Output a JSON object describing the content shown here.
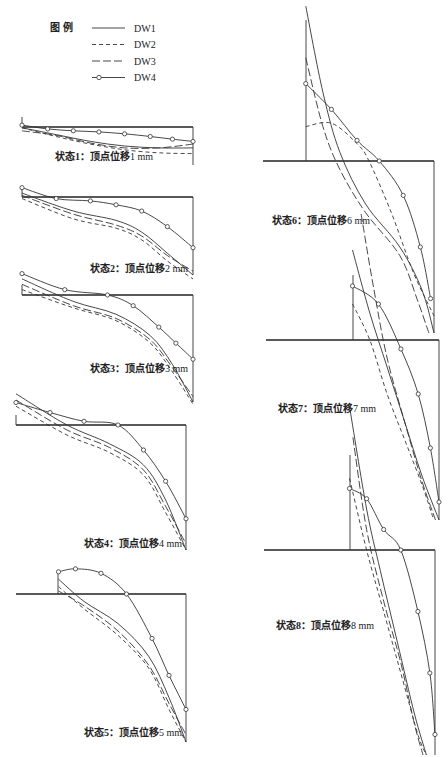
{
  "chart_data": {
    "type": "line",
    "legend": {
      "title": "图 例",
      "placement": "top-left",
      "entries": [
        {
          "name": "DW1",
          "style": "solid"
        },
        {
          "name": "DW2",
          "style": "short-dash"
        },
        {
          "name": "DW3",
          "style": "long-dash"
        },
        {
          "name": "DW4",
          "style": "solid-circle-marker"
        }
      ]
    },
    "series_names": [
      "DW1",
      "DW2",
      "DW3",
      "DW4"
    ],
    "xlabel": "",
    "ylabel": "",
    "panels": [
      {
        "id": 1,
        "caption_prefix": "状态1：顶点位移",
        "caption_value": "1 mm",
        "series": {
          "DW1": [
            [
              0,
              0.02
            ],
            [
              0.2,
              0.2
            ],
            [
              0.4,
              0.38
            ],
            [
              0.6,
              0.5
            ],
            [
              0.8,
              0.55
            ],
            [
              1,
              0.55
            ]
          ],
          "DW2": [
            [
              0,
              0.02
            ],
            [
              0.2,
              0.25
            ],
            [
              0.4,
              0.45
            ],
            [
              0.6,
              0.6
            ],
            [
              0.8,
              0.68
            ],
            [
              1,
              0.7
            ]
          ],
          "DW3": [
            [
              0,
              0.1
            ],
            [
              0.2,
              0.22
            ],
            [
              0.4,
              0.42
            ],
            [
              0.6,
              0.55
            ],
            [
              0.8,
              0.55
            ],
            [
              1,
              0.45
            ]
          ],
          "DW4": [
            [
              0,
              -0.05
            ],
            [
              0.15,
              0.05
            ],
            [
              0.3,
              0.1
            ],
            [
              0.45,
              0.13
            ],
            [
              0.6,
              0.18
            ],
            [
              0.75,
              0.25
            ],
            [
              0.88,
              0.32
            ],
            [
              1,
              0.38
            ]
          ]
        }
      },
      {
        "id": 2,
        "caption_prefix": "状态2：顶点位移",
        "caption_value": "2 mm",
        "series": {
          "DW1": [
            [
              0,
              -0.05
            ],
            [
              0.3,
              0.18
            ],
            [
              0.55,
              0.3
            ],
            [
              0.7,
              0.45
            ],
            [
              0.85,
              0.72
            ],
            [
              1,
              1.0
            ]
          ],
          "DW2": [
            [
              0,
              0.02
            ],
            [
              0.3,
              0.28
            ],
            [
              0.55,
              0.4
            ],
            [
              0.7,
              0.55
            ],
            [
              0.85,
              0.82
            ],
            [
              1,
              1.05
            ]
          ],
          "DW3": [
            [
              0,
              -0.02
            ],
            [
              0.3,
              0.22
            ],
            [
              0.55,
              0.36
            ],
            [
              0.7,
              0.5
            ],
            [
              0.85,
              0.75
            ],
            [
              1,
              0.95
            ]
          ],
          "DW4": [
            [
              0,
              -0.12
            ],
            [
              0.2,
              0.02
            ],
            [
              0.4,
              0.05
            ],
            [
              0.55,
              0.1
            ],
            [
              0.7,
              0.18
            ],
            [
              0.85,
              0.38
            ],
            [
              1,
              0.65
            ]
          ]
        }
      },
      {
        "id": 3,
        "caption_prefix": "状态3：顶点位移",
        "caption_value": "3 mm",
        "series": {
          "DW1": [
            [
              0,
              -0.15
            ],
            [
              0.3,
              0.06
            ],
            [
              0.55,
              0.18
            ],
            [
              0.75,
              0.38
            ],
            [
              0.88,
              0.65
            ],
            [
              1,
              1.0
            ]
          ],
          "DW2": [
            [
              0,
              -0.05
            ],
            [
              0.3,
              0.12
            ],
            [
              0.55,
              0.24
            ],
            [
              0.75,
              0.45
            ],
            [
              0.88,
              0.72
            ],
            [
              1,
              1.02
            ]
          ],
          "DW3": [
            [
              0,
              -0.1
            ],
            [
              0.3,
              0.1
            ],
            [
              0.55,
              0.22
            ],
            [
              0.75,
              0.42
            ],
            [
              0.88,
              0.68
            ],
            [
              1,
              0.95
            ]
          ],
          "DW4": [
            [
              0,
              -0.2
            ],
            [
              0.25,
              -0.05
            ],
            [
              0.5,
              0.0
            ],
            [
              0.65,
              0.1
            ],
            [
              0.8,
              0.3
            ],
            [
              0.9,
              0.45
            ],
            [
              1,
              0.6
            ]
          ]
        }
      },
      {
        "id": 4,
        "caption_prefix": "状态4：顶点位移",
        "caption_value": "4 mm",
        "series": {
          "DW1": [
            [
              0,
              -0.25
            ],
            [
              0.3,
              0.0
            ],
            [
              0.55,
              0.15
            ],
            [
              0.75,
              0.32
            ],
            [
              0.88,
              0.6
            ],
            [
              1,
              1.0
            ]
          ],
          "DW2": [
            [
              0,
              -0.15
            ],
            [
              0.3,
              0.08
            ],
            [
              0.55,
              0.22
            ],
            [
              0.75,
              0.4
            ],
            [
              0.88,
              0.7
            ],
            [
              1,
              1.0
            ]
          ],
          "DW3": [
            [
              0,
              -0.2
            ],
            [
              0.3,
              0.04
            ],
            [
              0.55,
              0.18
            ],
            [
              0.75,
              0.36
            ],
            [
              0.88,
              0.65
            ],
            [
              1,
              0.95
            ]
          ],
          "DW4": [
            [
              0,
              -0.18
            ],
            [
              0.2,
              -0.1
            ],
            [
              0.4,
              -0.03
            ],
            [
              0.6,
              0.0
            ],
            [
              0.75,
              0.2
            ],
            [
              0.88,
              0.45
            ],
            [
              1,
              0.75
            ]
          ]
        }
      },
      {
        "id": 5,
        "caption_prefix": "状态5：顶点位移",
        "caption_value": "5 mm",
        "series": {
          "DW1": [
            [
              0.25,
              -0.1
            ],
            [
              0.4,
              0.05
            ],
            [
              0.6,
              0.2
            ],
            [
              0.78,
              0.42
            ],
            [
              0.9,
              0.7
            ],
            [
              1,
              1.0
            ]
          ],
          "DW2": [
            [
              0.25,
              -0.05
            ],
            [
              0.4,
              0.1
            ],
            [
              0.6,
              0.28
            ],
            [
              0.78,
              0.5
            ],
            [
              0.9,
              0.78
            ],
            [
              1,
              1.0
            ]
          ],
          "DW3": [
            [
              0.25,
              -0.02
            ],
            [
              0.4,
              0.08
            ],
            [
              0.6,
              0.25
            ],
            [
              0.78,
              0.48
            ],
            [
              0.9,
              0.74
            ],
            [
              1,
              0.95
            ]
          ],
          "DW4": [
            [
              0.25,
              -0.15
            ],
            [
              0.35,
              -0.17
            ],
            [
              0.5,
              -0.14
            ],
            [
              0.65,
              0.0
            ],
            [
              0.8,
              0.3
            ],
            [
              0.9,
              0.55
            ],
            [
              1,
              0.78
            ]
          ]
        }
      },
      {
        "id": 6,
        "caption_prefix": "状态6：顶点位移",
        "caption_value": "6 mm",
        "series": {
          "DW1": [
            [
              0.25,
              -0.9
            ],
            [
              0.35,
              -0.4
            ],
            [
              0.45,
              -0.05
            ],
            [
              0.6,
              0.25
            ],
            [
              0.8,
              0.5
            ],
            [
              0.93,
              0.75
            ],
            [
              1,
              1.0
            ]
          ],
          "DW2": [
            [
              0.25,
              -0.2
            ],
            [
              0.4,
              -0.22
            ],
            [
              0.55,
              -0.1
            ],
            [
              0.62,
              0.0
            ],
            [
              0.75,
              0.3
            ],
            [
              0.88,
              0.65
            ],
            [
              1,
              0.9
            ]
          ],
          "DW3": [
            [
              0.25,
              -0.6
            ],
            [
              0.35,
              -0.2
            ],
            [
              0.45,
              0.05
            ],
            [
              0.6,
              0.3
            ],
            [
              0.8,
              0.55
            ],
            [
              0.9,
              0.8
            ],
            [
              0.97,
              1.0
            ]
          ],
          "DW4": [
            [
              0.25,
              -0.45
            ],
            [
              0.4,
              -0.3
            ],
            [
              0.55,
              -0.12
            ],
            [
              0.68,
              0.0
            ],
            [
              0.82,
              0.2
            ],
            [
              0.92,
              0.5
            ],
            [
              0.98,
              0.8
            ]
          ]
        }
      },
      {
        "id": 7,
        "caption_prefix": "状态7：顶点位移",
        "caption_value": "7 mm",
        "series": {
          "DW1": [
            [
              0.5,
              -0.5
            ],
            [
              0.6,
              -0.15
            ],
            [
              0.7,
              0.15
            ],
            [
              0.8,
              0.45
            ],
            [
              0.9,
              0.75
            ],
            [
              1,
              1.0
            ]
          ],
          "DW2": [
            [
              0.5,
              -0.2
            ],
            [
              0.6,
              0.0
            ],
            [
              0.7,
              0.3
            ],
            [
              0.8,
              0.55
            ],
            [
              0.9,
              0.8
            ],
            [
              0.97,
              1.0
            ]
          ],
          "DW3": [
            [
              0.55,
              -0.7
            ],
            [
              0.62,
              -0.3
            ],
            [
              0.7,
              0.1
            ],
            [
              0.8,
              0.45
            ],
            [
              0.9,
              0.78
            ],
            [
              0.98,
              1.0
            ]
          ],
          "DW4": [
            [
              0.5,
              -0.3
            ],
            [
              0.65,
              -0.2
            ],
            [
              0.78,
              0.05
            ],
            [
              0.88,
              0.3
            ],
            [
              0.95,
              0.6
            ],
            [
              1,
              0.9
            ]
          ]
        }
      },
      {
        "id": 8,
        "caption_prefix": "状态8：顶点位移",
        "caption_value": "8 mm",
        "series": {
          "DW1": [
            [
              0.5,
              -0.7
            ],
            [
              0.6,
              -0.2
            ],
            [
              0.68,
              0.1
            ],
            [
              0.78,
              0.45
            ],
            [
              0.88,
              0.8
            ],
            [
              0.95,
              1.0
            ]
          ],
          "DW2": [
            [
              0.5,
              -0.35
            ],
            [
              0.6,
              0.0
            ],
            [
              0.7,
              0.3
            ],
            [
              0.8,
              0.6
            ],
            [
              0.9,
              0.9
            ],
            [
              0.95,
              1.0
            ]
          ],
          "DW3": [
            [
              0.52,
              -0.55
            ],
            [
              0.6,
              -0.1
            ],
            [
              0.7,
              0.25
            ],
            [
              0.8,
              0.55
            ],
            [
              0.88,
              0.85
            ],
            [
              0.93,
              1.0
            ]
          ],
          "DW4": [
            [
              0.5,
              -0.3
            ],
            [
              0.6,
              -0.25
            ],
            [
              0.7,
              -0.1
            ],
            [
              0.8,
              0.0
            ],
            [
              0.9,
              0.3
            ],
            [
              0.97,
              0.6
            ],
            [
              1,
              0.9
            ]
          ]
        }
      }
    ]
  }
}
